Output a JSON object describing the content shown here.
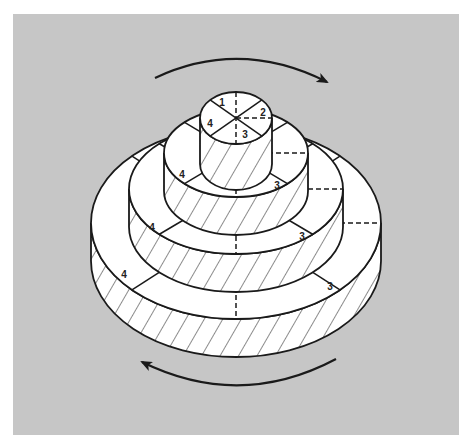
{
  "figure": {
    "background_color": "#ffffff",
    "panel_color": "#c6c6c6",
    "stroke_color": "#1a1a1a",
    "face_color": "#ffffff",
    "panel": {
      "x": 13,
      "y": 14,
      "width": 446,
      "height": 421
    }
  },
  "rotation_arrows": [
    {
      "name": "rotation-arrow-top",
      "direction": "clockwise",
      "from": [
        155,
        78
      ],
      "to": [
        327,
        82
      ],
      "arrowhead": "right"
    },
    {
      "name": "rotation-arrow-bottom",
      "direction": "counterclockwise",
      "from": [
        336,
        359
      ],
      "to": [
        142,
        362
      ],
      "arrowhead": "left"
    }
  ],
  "tiers": [
    {
      "name": "tier-1-top",
      "cx": 236,
      "cy": 118,
      "rx": 36,
      "ry": 26,
      "height": 46
    },
    {
      "name": "tier-2",
      "cx": 236,
      "cy": 153,
      "rx": 72,
      "ry": 44,
      "height": 38
    },
    {
      "name": "tier-3",
      "cx": 236,
      "cy": 189,
      "rx": 107,
      "ry": 65,
      "height": 38
    },
    {
      "name": "tier-4-bottom",
      "cx": 236,
      "cy": 223,
      "rx": 145,
      "ry": 96,
      "height": 38
    }
  ],
  "labels": [
    {
      "text": "1",
      "x": 222,
      "y": 106
    },
    {
      "text": "2",
      "x": 263,
      "y": 116
    },
    {
      "text": "4",
      "x": 210,
      "y": 127
    },
    {
      "text": "3",
      "x": 245,
      "y": 138
    },
    {
      "text": "4",
      "x": 182,
      "y": 178
    },
    {
      "text": "3",
      "x": 277,
      "y": 189
    },
    {
      "text": "4",
      "x": 152,
      "y": 231
    },
    {
      "text": "3",
      "x": 302,
      "y": 240
    },
    {
      "text": "4",
      "x": 124,
      "y": 278
    },
    {
      "text": "3",
      "x": 330,
      "y": 290
    }
  ]
}
